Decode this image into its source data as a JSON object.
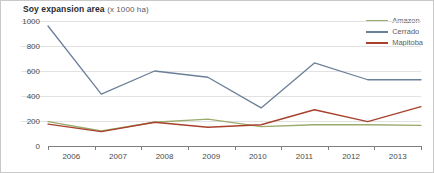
{
  "chart_data": {
    "type": "line",
    "title": "Soy expansion area",
    "title_unit": "(x 1000 ha)",
    "xlabel": "",
    "ylabel": "",
    "x": [
      2006,
      2007,
      2008,
      2009,
      2010,
      2011,
      2012,
      2013
    ],
    "xtick_labels": [
      "2006",
      "2007",
      "2008",
      "2009",
      "2010",
      "2011",
      "2012",
      "2013"
    ],
    "ytick_labels": [
      "1000",
      "800",
      "600",
      "400",
      "200",
      "0"
    ],
    "ytick_values": [
      1000,
      800,
      600,
      400,
      200,
      0
    ],
    "ylim": [
      0,
      1000
    ],
    "xlim": [
      2006,
      2013
    ],
    "grid": true,
    "legend_position": "top-right",
    "series": [
      {
        "name": "Amazon",
        "color": "#9aab6e",
        "values": [
          195,
          120,
          190,
          215,
          155,
          170,
          170,
          165
        ]
      },
      {
        "name": "Cerrado",
        "color": "#6b7f99",
        "values": [
          960,
          415,
          600,
          550,
          305,
          665,
          530,
          530
        ]
      },
      {
        "name": "Mapitoba",
        "color": "#a8412c",
        "values": [
          175,
          115,
          190,
          150,
          170,
          290,
          195,
          315
        ]
      }
    ]
  }
}
